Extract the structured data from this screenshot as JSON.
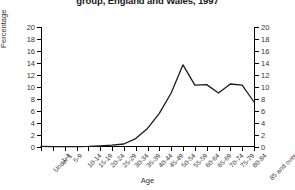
{
  "chart_data": {
    "type": "line",
    "title": "group, England and Wales, 1997",
    "xlabel": "Age",
    "ylabel": "Percentage",
    "ylim": [
      0,
      20
    ],
    "yticks": [
      0,
      2,
      4,
      6,
      8,
      10,
      12,
      14,
      16,
      18,
      20
    ],
    "ytick_labels": [
      "0",
      "2",
      "4",
      "6",
      "8",
      "10",
      "12",
      "14",
      "16",
      "18",
      "20"
    ],
    "right_axis": true,
    "right_ytick_labels": [
      "0",
      "2",
      "4",
      "6",
      "8",
      "10",
      "12",
      "14",
      "16",
      "18",
      "20"
    ],
    "grid": false,
    "legend": "none",
    "line_color": "#1a1a1a",
    "categories": [
      "Under 1",
      "1-4",
      "5-9",
      "10-14",
      "15-19",
      "20-24",
      "25-29",
      "30-34",
      "35-39",
      "40-44",
      "45-49",
      "50-54",
      "55-59",
      "60-64",
      "65-69",
      "70-74",
      "75-79",
      "80-84",
      "85 and over"
    ],
    "values": [
      0.1,
      0.05,
      0.05,
      0.05,
      0.1,
      0.2,
      0.3,
      0.5,
      1.4,
      3.1,
      5.6,
      9.0,
      13.7,
      10.3,
      10.4,
      9.0,
      10.5,
      10.3,
      7.5
    ]
  }
}
